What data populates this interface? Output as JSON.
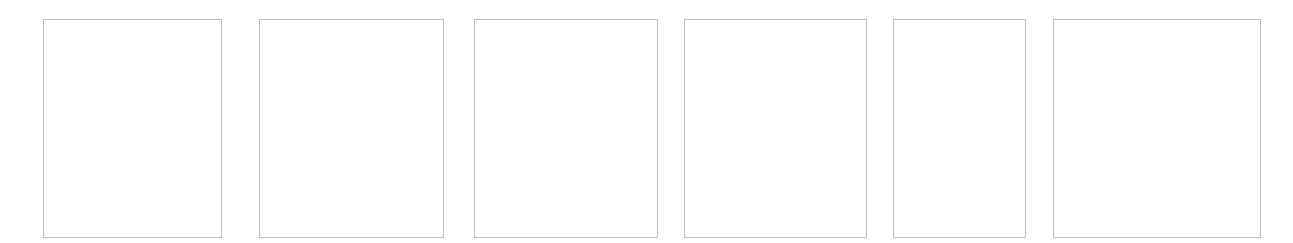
{
  "canvas": {
    "width": 1293,
    "height": 243,
    "background": "#ffffff",
    "border_color": "#bdbdbd"
  },
  "panels": [
    {
      "id": "panel-1",
      "x": 43,
      "y": 19,
      "w": 179,
      "h": 219,
      "content": ""
    },
    {
      "id": "panel-2",
      "x": 259,
      "y": 19,
      "w": 185,
      "h": 219,
      "content": ""
    },
    {
      "id": "panel-3",
      "x": 474,
      "y": 19,
      "w": 184,
      "h": 219,
      "content": ""
    },
    {
      "id": "panel-4",
      "x": 684,
      "y": 19,
      "w": 183,
      "h": 219,
      "content": ""
    },
    {
      "id": "panel-5",
      "x": 893,
      "y": 19,
      "w": 133,
      "h": 219,
      "content": ""
    },
    {
      "id": "panel-6",
      "x": 1053,
      "y": 19,
      "w": 208,
      "h": 219,
      "content": ""
    }
  ]
}
